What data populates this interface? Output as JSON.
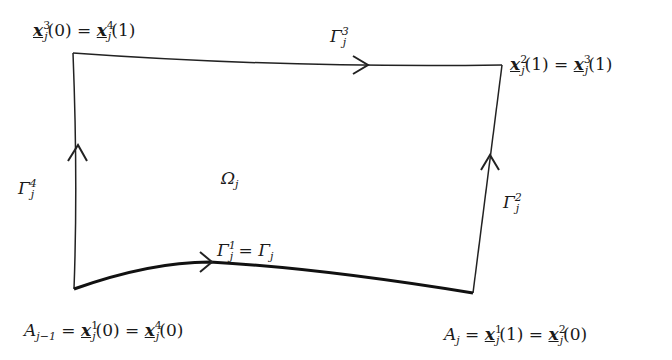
{
  "diagram": {
    "type": "domain-boundary",
    "region": {
      "name": "Ω",
      "sub": "j"
    },
    "edges": [
      {
        "id": "gamma1",
        "label": "Γ",
        "sub": "j",
        "sup": "1",
        "suffix": " = Γ",
        "suffix_sub": "j",
        "direction": "right",
        "emphasis": "thick"
      },
      {
        "id": "gamma2",
        "label": "Γ",
        "sub": "j",
        "sup": "2",
        "direction": "up"
      },
      {
        "id": "gamma3",
        "label": "Γ",
        "sub": "j",
        "sup": "3",
        "direction": "right"
      },
      {
        "id": "gamma4",
        "label": "Γ",
        "sub": "j",
        "sup": "4",
        "direction": "up"
      }
    ],
    "corners": {
      "top_left": {
        "lhs_sup": "3",
        "lhs_arg": "(0)",
        "rhs_sup": "4",
        "rhs_arg": "(1)"
      },
      "top_right": {
        "lhs_sup": "2",
        "lhs_arg": "(1)",
        "rhs_sup": "3",
        "rhs_arg": "(1)"
      },
      "bottom_left": {
        "prefix": "A",
        "prefix_sub": "j−1",
        "lhs_sup": "1",
        "lhs_arg": "(0)",
        "rhs_sup": "4",
        "rhs_arg": "(0)"
      },
      "bottom_right": {
        "prefix": "A",
        "prefix_sub": "j",
        "lhs_sup": "1",
        "lhs_arg": "(1)",
        "rhs_sup": "2",
        "rhs_arg": "(0)"
      }
    },
    "symbols": {
      "x": "x",
      "j": "j",
      "eq": " = "
    }
  }
}
